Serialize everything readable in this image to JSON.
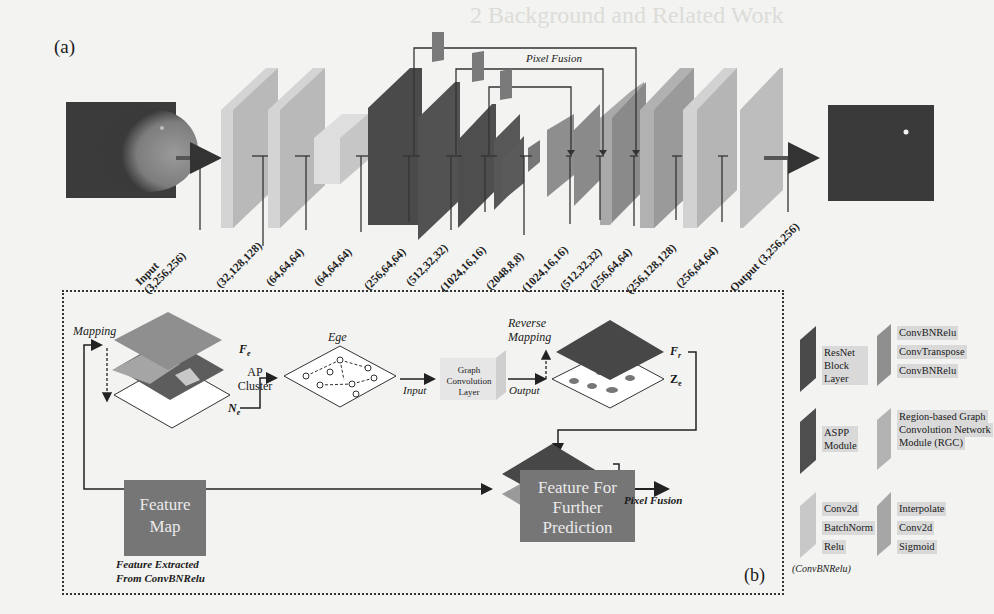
{
  "background_ghost": {
    "heading": "2   Background and Related Work"
  },
  "panel_a": {
    "label": "(a)",
    "pixel_fusion_label": "Pixel Fusion",
    "input_image": "mammogram-input",
    "output_image": "segmentation-mask-output",
    "layers": [
      {
        "dim": "Input\n(3,256,256)",
        "type": "input"
      },
      {
        "dim": "(32,128,128)",
        "type": "ConvBNRelu"
      },
      {
        "dim": "(64,64,64)",
        "type": "ConvBNRelu"
      },
      {
        "dim": "(64,64,64)",
        "type": "RGC"
      },
      {
        "dim": "(256,64,64)",
        "type": "ResNet Block Layer"
      },
      {
        "dim": "(512,32,32)",
        "type": "ResNet Block Layer"
      },
      {
        "dim": "(1024,16,16)",
        "type": "ResNet Block Layer"
      },
      {
        "dim": "(2048,8,8)",
        "type": "ResNet Block Layer"
      },
      {
        "dim": "(1024,16,16)",
        "type": "ConvTranspose block"
      },
      {
        "dim": "(512,32,32)",
        "type": "ConvTranspose block"
      },
      {
        "dim": "(256,64,64)",
        "type": "ConvTranspose block"
      },
      {
        "dim": "(256,128,128)",
        "type": "ConvTranspose block"
      },
      {
        "dim": "(256,64,64)",
        "type": "ConvBNRelu"
      },
      {
        "dim": "Output (3,256,256)",
        "type": "output"
      }
    ]
  },
  "panel_b": {
    "label": "(b)",
    "mapping": "Mapping",
    "feature_map": "Feature Map",
    "fe": "F",
    "fe_sub": "e",
    "ap_cluster": "AP Cluster",
    "ne": "N",
    "ne_sub": "e",
    "ege": "Ege",
    "input": "Input",
    "gcl": "Graph Convolution Layer",
    "output": "Output",
    "reverse_mapping": "Reverse Mapping",
    "fr": "F",
    "fr_sub": "r",
    "ze": "Z",
    "ze_sub": "e",
    "feature_map_box": "Feature Map",
    "feature_extracted_1": "Feature  Extracted",
    "feature_extracted_2": "From ConvBNRelu",
    "pixel_fusion": "Pixel Fusion",
    "further": "Feature For Further Prediction"
  },
  "legend": {
    "resnet": "ResNet Block Layer",
    "convt": [
      "ConvBNRelu",
      "ConvTranspose",
      "ConvBNRelu"
    ],
    "aspp": "ASPP Module",
    "rgc": [
      "Region-based Graph",
      "Convolution Network",
      "Module (RGC)"
    ],
    "convbn": [
      "Conv2d",
      "BatchNorm",
      "Relu"
    ],
    "convbn_caption": "(ConvBNRelu)",
    "head": [
      "Interpolate",
      "Conv2d",
      "Sigmoid"
    ]
  },
  "colors": {
    "dark": "#4a4a4a",
    "mid": "#7d7d7d",
    "light": "#b3b3b3",
    "lighter": "#cfcfcf"
  }
}
